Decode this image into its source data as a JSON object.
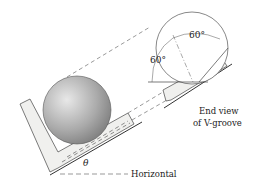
{
  "figure": {
    "labels": {
      "angle_top": "60°",
      "angle_left": "60°",
      "end_view_line1": "End view",
      "end_view_line2": "of V-groove",
      "theta": "θ",
      "horizontal": "Horizontal"
    },
    "colors": {
      "line": "#333333",
      "block_fill": "#f0f0ee",
      "sphere_light": "#e6e6e6",
      "sphere_dark": "#8a8a8a"
    }
  }
}
